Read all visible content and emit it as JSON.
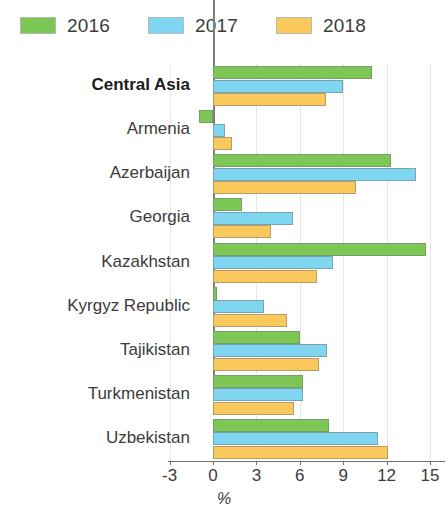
{
  "legend": {
    "items": [
      {
        "label": "2016",
        "color": "#7DC855"
      },
      {
        "label": "2017",
        "color": "#7FD6F0"
      },
      {
        "label": "2018",
        "color": "#F9C95C"
      }
    ]
  },
  "axis": {
    "title": "%",
    "ticks": [
      "-3",
      "0",
      "3",
      "6",
      "9",
      "12",
      "15"
    ]
  },
  "chart_data": {
    "type": "bar",
    "orientation": "horizontal",
    "title": "",
    "xlabel": "%",
    "ylabel": "",
    "xlim": [
      -3,
      15
    ],
    "xticks": [
      -3,
      0,
      3,
      6,
      9,
      12,
      15
    ],
    "grid": true,
    "legend_position": "top",
    "categories": [
      "Central Asia",
      "Armenia",
      "Azerbaijan",
      "Georgia",
      "Kazakhstan",
      "Kyrgyz Republic",
      "Tajikistan",
      "Turkmenistan",
      "Uzbekistan"
    ],
    "emphasized_categories": [
      "Central Asia"
    ],
    "series": [
      {
        "name": "2016",
        "color": "#7DC855",
        "values": [
          11.0,
          -1.0,
          12.3,
          2.0,
          14.7,
          0.3,
          6.0,
          6.2,
          8.0
        ]
      },
      {
        "name": "2017",
        "color": "#7FD6F0",
        "values": [
          9.0,
          0.8,
          14.0,
          5.5,
          8.3,
          3.5,
          7.9,
          6.2,
          11.4
        ]
      },
      {
        "name": "2018",
        "color": "#F9C95C",
        "values": [
          7.8,
          1.3,
          9.9,
          4.0,
          7.2,
          5.1,
          7.3,
          5.6,
          12.1
        ]
      }
    ]
  }
}
